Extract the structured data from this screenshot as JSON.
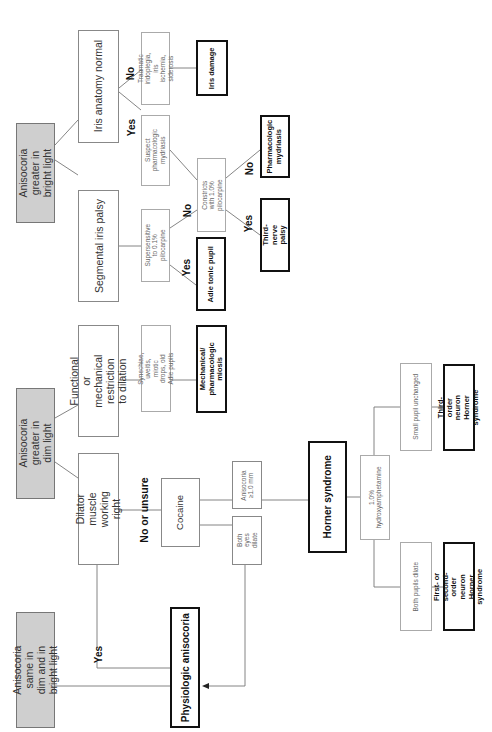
{
  "diagram": {
    "type": "flowchart",
    "orientation": "rotated-90-ccw",
    "roots": {
      "bright": "Anisocoria greater in bright light",
      "dim": "Anisocoria greater in dim light",
      "same": "Anisocoria same in dim and in bright light"
    },
    "nodes": {
      "iris_normal": "Iris anatomy normal",
      "segmental": "Segmental iris palsy",
      "functional": "Functional or mechanical restriction to dilation",
      "dilator": "Dilator muscle working right",
      "traumatic": "Traumatic iridoplegia, iris ischemia, siderosis",
      "suspect": "Suspect pharmacologic mydriasis",
      "supersensitive": "Supersensitive to 0.1% pilocarpine",
      "constricts": "Constricts with 1.0% pilocarpine",
      "synechiae": "Synechiae, uveitis, miotic drops, old Adie pupils",
      "cocaine": "Cocaine",
      "aniso_1mm": "Anisocoria ≥1.0 mm",
      "both_eyes": "Both eyes dilate",
      "hydroxy": "1.0% hydroxyamphetamine",
      "small_pupil": "Small pupil unchanged",
      "both_pupils": "Both pupils dilate"
    },
    "outcomes": {
      "iris_damage": "Iris damage",
      "pharm_mydriasis": "Pharmacologic mydriasis",
      "third_nerve": "Third-nerve palsy",
      "adie": "Adie tonic pupil",
      "mech_miosis": "Mechanical/ pharmacologic miosis",
      "horner": "Horner syndrome",
      "third_order": "Third-order neuron Horner syndrome",
      "first_second": "First- or second-order neuron Horner syndrome",
      "physiologic": "Physiologic anisocoria"
    },
    "edge_labels": {
      "no_traumatic": "No",
      "yes_suspect": "Yes",
      "no_constricts": "No",
      "yes_adie": "Yes",
      "no_pharm": "No",
      "yes_third": "Yes",
      "no_or_unsure": "No or unsure",
      "yes_physiologic": "Yes"
    }
  }
}
